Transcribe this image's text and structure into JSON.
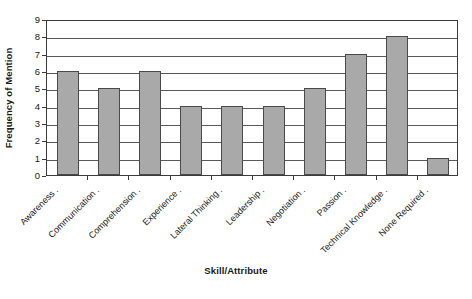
{
  "chart_data": {
    "type": "bar",
    "title": "",
    "subtitle": "",
    "xlabel": "Skill/Attribute",
    "ylabel": "Frequency of Mention",
    "categories": [
      "Awareness",
      "Communication",
      "Comprehension",
      "Experience",
      "Lateral Thinking",
      "Leadership",
      "Negotiation",
      "Passion",
      "Technical Knowledge",
      "None Required"
    ],
    "values": [
      6,
      5,
      6,
      4,
      4,
      4,
      5,
      7,
      8,
      1
    ],
    "ylim": [
      0,
      9
    ],
    "ytick_labels": [
      "0",
      "1",
      "2",
      "3",
      "4",
      "5",
      "6",
      "7",
      "8",
      "9"
    ],
    "ytick_values": [
      0,
      1,
      2,
      3,
      4,
      5,
      6,
      7,
      8,
      9
    ],
    "grid": true,
    "grid_axis": "y",
    "legend": false,
    "legend_position": "none",
    "bar_fill_color": "#a9a9a9",
    "bar_border_color": "#4a4a4a",
    "gridline_color": "#5a5a5a",
    "axis_color": "#3b3b3b",
    "background_color": "#ffffff",
    "xtick_label_rotation": -45
  }
}
